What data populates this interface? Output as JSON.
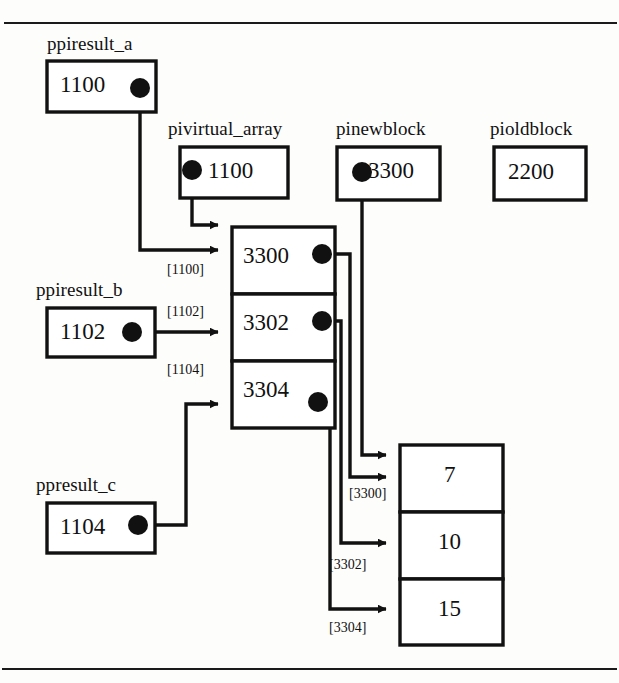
{
  "figure": {
    "type": "memory-pointer-diagram",
    "title": "",
    "variables": [
      {
        "id": "ppiresult_a",
        "name": "ppiresult_a",
        "value": "1100",
        "has_pointer_dot": true,
        "dot_side": "right"
      },
      {
        "id": "pivirtual_array",
        "name": "pivirtual_array",
        "value": "1100",
        "has_pointer_dot": true,
        "dot_side": "left"
      },
      {
        "id": "pinewblock",
        "name": "pinewblock",
        "value": "3300",
        "has_pointer_dot": true,
        "dot_side": "left"
      },
      {
        "id": "pioldblock",
        "name": "pioldblock",
        "value": "2200",
        "has_pointer_dot": false,
        "dot_side": "none"
      },
      {
        "id": "ppiresult_b",
        "name": "ppiresult_b",
        "value": "1102",
        "has_pointer_dot": true,
        "dot_side": "right"
      },
      {
        "id": "ppresult_c",
        "name": "ppresult_c",
        "value": "1104",
        "has_pointer_dot": true,
        "dot_side": "right"
      }
    ],
    "pointer_array": {
      "id": "pointer-array",
      "cells": [
        {
          "address": "[1100]",
          "value": "3300",
          "has_pointer_dot": true
        },
        {
          "address": "[1102]",
          "value": "3302",
          "has_pointer_dot": true
        },
        {
          "address": "[1104]",
          "value": "3304",
          "has_pointer_dot": true
        }
      ]
    },
    "value_array": {
      "id": "value-array",
      "cells": [
        {
          "address": "[3300]",
          "value": "7"
        },
        {
          "address": "[3302]",
          "value": "10"
        },
        {
          "address": "[3304]",
          "value": "15"
        }
      ]
    },
    "colors": {
      "ink": "#111111",
      "paper": "#fdfdfc",
      "rule": "#1a1a1a"
    }
  }
}
